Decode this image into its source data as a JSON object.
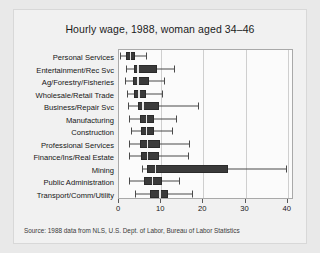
{
  "chart_data": {
    "type": "boxplot",
    "title": "Hourly wage, 1988, woman aged 34–46",
    "xlabel": "",
    "ylabel": "",
    "xlim": [
      0,
      41.5
    ],
    "grid": true,
    "legend_position": "none",
    "source_note": "Source:  1988 data from NLS, U.S. Dept. of Labor, Bureau of Labor Statistics",
    "xticks": [
      0,
      10,
      20,
      30,
      40
    ],
    "xtick_labels": [
      "0",
      "10",
      "20",
      "30",
      "40"
    ],
    "categories": [
      "Personal Services",
      "Entertainment/Rec Svc",
      "Ag/Forestry/Fisheries",
      "Wholesale/Retail Trade",
      "Business/Repair Svc",
      "Manufacturing",
      "Construction",
      "Professional Services",
      "Finance/Ins/Real Estate",
      "Mining",
      "Public Administration",
      "Transport/Comm/Utility"
    ],
    "boxes": [
      {
        "category": "Personal Services",
        "whisker_low": 0.3,
        "q1": 1.6,
        "median": 2.6,
        "q3": 3.9,
        "whisker_high": 6.3
      },
      {
        "category": "Entertainment/Rec Svc",
        "whisker_low": 1.6,
        "q1": 3.5,
        "median": 4.3,
        "q3": 9.0,
        "whisker_high": 13.0
      },
      {
        "category": "Ag/Forestry/Fisheries",
        "whisker_low": 1.5,
        "q1": 3.4,
        "median": 4.3,
        "q3": 7.1,
        "whisker_high": 10.6
      },
      {
        "category": "Wholesale/Retail Trade",
        "whisker_low": 1.9,
        "q1": 3.6,
        "median": 4.6,
        "q3": 6.3,
        "whisker_high": 10.2
      },
      {
        "category": "Business/Repair Svc",
        "whisker_low": 2.1,
        "q1": 4.4,
        "median": 5.5,
        "q3": 9.6,
        "whisker_high": 18.8
      },
      {
        "category": "Manufacturing",
        "whisker_low": 2.3,
        "q1": 5.0,
        "median": 6.3,
        "q3": 8.4,
        "whisker_high": 13.5
      },
      {
        "category": "Construction",
        "whisker_low": 2.8,
        "q1": 5.2,
        "median": 6.4,
        "q3": 8.3,
        "whisker_high": 12.5
      },
      {
        "category": "Professional Services",
        "whisker_low": 2.4,
        "q1": 5.0,
        "median": 6.6,
        "q3": 9.8,
        "whisker_high": 16.6
      },
      {
        "category": "Finance/Ins/Real Estate",
        "whisker_low": 2.4,
        "q1": 5.3,
        "median": 6.6,
        "q3": 9.4,
        "whisker_high": 16.3
      },
      {
        "category": "Mining",
        "whisker_low": 5.4,
        "q1": 6.6,
        "median": 8.5,
        "q3": 25.9,
        "whisker_high": 39.6
      },
      {
        "category": "Public Administration",
        "whisker_low": 2.4,
        "q1": 6.0,
        "median": 7.8,
        "q3": 10.1,
        "whisker_high": 14.2
      },
      {
        "category": "Transport/Comm/Utility",
        "whisker_low": 3.9,
        "q1": 7.4,
        "median": 9.5,
        "q3": 11.6,
        "whisker_high": 17.3
      }
    ]
  },
  "colors": {
    "page_background": "#e9e9e9",
    "figure_background": "#f1f1f1",
    "plot_background": "#fbfbfb",
    "box_fill": "#3a3a3a",
    "median_line": "#e8e8e8",
    "whisker": "#4a4a4a",
    "gridline": "#cfcfcf",
    "axis": "#a9a9a9",
    "text": "#161616"
  }
}
